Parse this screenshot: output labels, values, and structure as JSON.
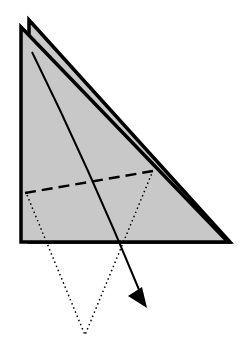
{
  "diagram": {
    "type": "origami-fold-step",
    "colors": {
      "paper_fill": "#c8c8c8",
      "outline": "#000000",
      "background": "#ffffff"
    },
    "shapes": {
      "back_layer": "29,20 230,242 29,242",
      "front_layer": "21,27 228,242 21,242",
      "fold_line": {
        "x1": 25,
        "y1": 193,
        "x2": 153,
        "y2": 171
      },
      "folded_outline": "27,195 85,335 152,173",
      "arrow_path": "M32,52 Q90,170 146,306"
    }
  }
}
